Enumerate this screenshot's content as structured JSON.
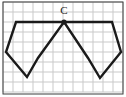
{
  "figure": {
    "canvas": {
      "width": 126,
      "height": 97
    },
    "background_color": "#ffffff",
    "grid": {
      "visible": true,
      "cell_size": 10,
      "origin_x": 3,
      "origin_y": 2,
      "line_color": "#c9c9c9",
      "line_width": 1,
      "columns": 12,
      "rows": 9
    },
    "frame": {
      "visible": true,
      "color": "#3c3c3c",
      "line_width": 1,
      "x": 3,
      "y": 2,
      "width": 120,
      "height": 92
    },
    "stroke_color": "#1a1a1a",
    "stroke_width": 2.4,
    "labels": [
      {
        "id": "vertex-c",
        "text": "C",
        "x": 64,
        "y": 14,
        "anchor": "middle",
        "font_size": 11,
        "color": "#1a1a1a"
      }
    ],
    "markers": [
      {
        "id": "vertex-c-dot",
        "shape": "filled-circle",
        "x": 64,
        "y": 22,
        "radius": 2.6,
        "color": "#1a1a1a"
      }
    ],
    "shapes": [
      {
        "id": "pentagon-left",
        "name": "Pentagon 1 (pre-image)",
        "sides": 5,
        "closed": true,
        "fill": "none",
        "stroke": "#1a1a1a",
        "stroke_width": 2.4,
        "points": [
          {
            "label": "C",
            "x": 64,
            "y": 22
          },
          {
            "label": "P1",
            "x": 16,
            "y": 22
          },
          {
            "label": "P2",
            "x": 6,
            "y": 52
          },
          {
            "label": "P3",
            "x": 27,
            "y": 77
          },
          {
            "label": "P4",
            "x": 38,
            "y": 58
          }
        ]
      },
      {
        "id": "pentagon-right",
        "name": "Pentagon 2 (image after rotation about C)",
        "sides": 5,
        "closed": true,
        "fill": "none",
        "stroke": "#1a1a1a",
        "stroke_width": 2.4,
        "points": [
          {
            "label": "C",
            "x": 64,
            "y": 22
          },
          {
            "label": "Q1",
            "x": 112,
            "y": 22
          },
          {
            "label": "Q2",
            "x": 121,
            "y": 52
          },
          {
            "label": "Q3",
            "x": 100,
            "y": 78
          },
          {
            "label": "Q4",
            "x": 88,
            "y": 58
          }
        ]
      }
    ]
  }
}
